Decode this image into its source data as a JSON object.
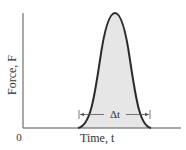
{
  "diagram": {
    "type": "force-time pulse",
    "y_axis_label": "Force, F",
    "x_axis_label": "Time, t",
    "origin_label": "0",
    "interval_label": "Δt",
    "colors": {
      "curve": "#2b2b2b",
      "fill": "#e6e6e6",
      "axis": "#555555",
      "text": "#333333"
    }
  }
}
